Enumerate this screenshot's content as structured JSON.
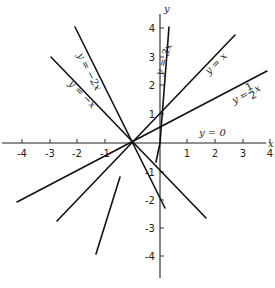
{
  "diagram": {
    "axes": {
      "x_label": "x",
      "y_label": "y",
      "x_ticks": [
        "-4",
        "-3",
        "-2",
        "-1",
        "1",
        "2",
        "3",
        "4"
      ],
      "y_ticks": [
        "4",
        "3",
        "2",
        "1",
        "-1",
        "-2",
        "-3",
        "-4"
      ]
    },
    "lines": [
      {
        "id": "y3x",
        "label": "y = 3x",
        "slope": 3
      },
      {
        "id": "yx",
        "label": "y = x",
        "slope": 1
      },
      {
        "id": "yhalfx",
        "label": "y = ½x",
        "label_prefix": "y =",
        "frac_num": "1",
        "frac_den": "2",
        "label_suffix": "x",
        "slope": 0.5
      },
      {
        "id": "y0",
        "label": "y = 0",
        "slope": 0
      },
      {
        "id": "yneg2x",
        "label": "y = −2x",
        "slope": -2
      },
      {
        "id": "ynegx",
        "label": "y = −x",
        "slope": -1
      }
    ]
  }
}
